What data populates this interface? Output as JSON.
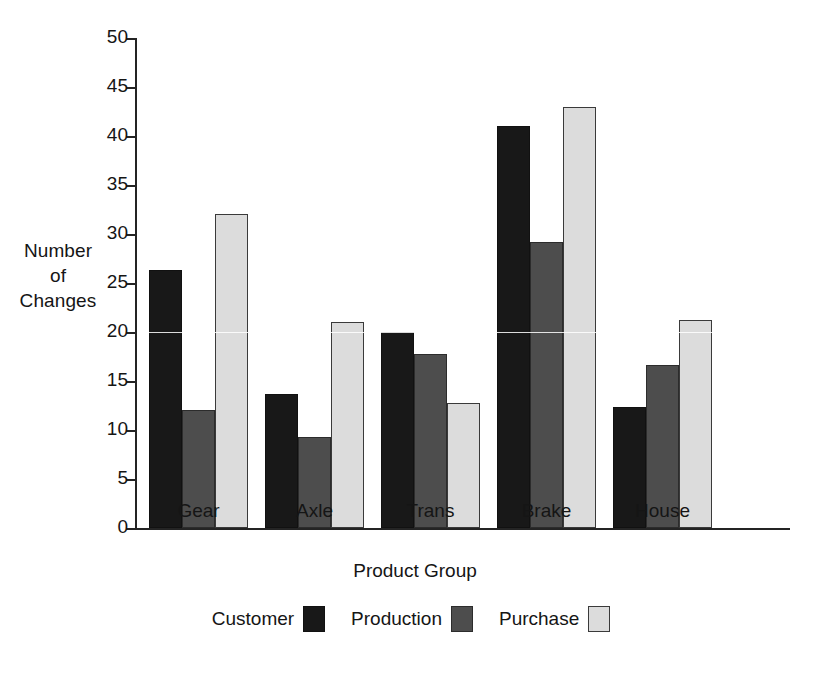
{
  "chart_data": {
    "type": "bar",
    "title": "",
    "xlabel": "Product Group",
    "ylabel": "Number of Changes",
    "ylabel_lines": [
      "Number",
      "of",
      "Changes"
    ],
    "categories": [
      "Gear",
      "Axle",
      "Trans",
      "Brake",
      "House"
    ],
    "series": [
      {
        "name": "Customer",
        "color": "#181818",
        "values": [
          26.3,
          13.7,
          20.0,
          41.0,
          12.3
        ]
      },
      {
        "name": "Production",
        "color": "#4d4d4d",
        "values": [
          12.0,
          9.3,
          17.8,
          29.2,
          16.6
        ]
      },
      {
        "name": "Purchase",
        "color": "#dcdcdc",
        "values": [
          32.0,
          21.0,
          12.8,
          43.0,
          21.2
        ]
      }
    ],
    "ylim": [
      0,
      50
    ],
    "yticks": [
      0,
      5,
      10,
      15,
      20,
      25,
      30,
      35,
      40,
      45,
      50
    ],
    "ytick_labels": [
      "0",
      "5",
      "10",
      "15",
      "20",
      "25",
      "30",
      "35",
      "40",
      "45",
      "50"
    ],
    "grid": false,
    "legend_position": "bottom",
    "legend_label_before_swatch": true,
    "axis_color": "#242424",
    "background": "#ffffff"
  }
}
